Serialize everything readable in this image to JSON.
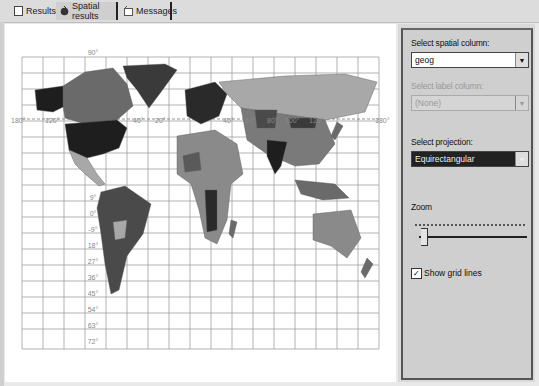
{
  "tabs": [
    {
      "label": "Results",
      "icon": "grid-icon",
      "active": false
    },
    {
      "label": "Spatial results",
      "icon": "globe-icon",
      "active": true
    },
    {
      "label": "Messages",
      "icon": "message-icon",
      "active": false
    }
  ],
  "map": {
    "projection_view": "Equirectangular world map",
    "grid_lines": true,
    "longitude_labels": [
      "180°",
      "150°",
      "120°",
      "90°",
      "60°",
      "30°",
      "0°",
      "30°",
      "60°",
      "90°",
      "120°",
      "150°",
      "180°"
    ],
    "latitude_labels": [
      "90°",
      "9°",
      "0°",
      "-9°",
      "18°",
      "27°",
      "36°",
      "45°",
      "54°",
      "63°",
      "72°"
    ]
  },
  "side_panel": {
    "spatial_column_label": "Select spatial column:",
    "spatial_column_value": "geog",
    "label_column_label": "Select label column:",
    "label_column_value": "(None)",
    "projection_label": "Select projection:",
    "projection_value": "Equirectangular",
    "zoom_label": "Zoom",
    "zoom_value": 0,
    "show_grid_lines_label": "Show grid lines",
    "show_grid_lines_checked": true
  },
  "colors": {
    "background": "#e9e9e9",
    "map_bg": "#ffffff",
    "land_dark": "#1e1e1e",
    "land_mid": "#6a6a6a",
    "land_light": "#a8a8a8",
    "grid": "#9a9a9a"
  }
}
